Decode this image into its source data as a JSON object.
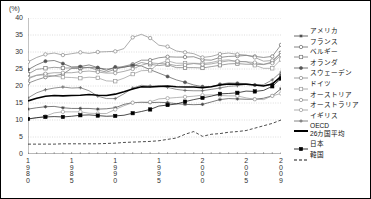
{
  "axis": {
    "unit_label": "(%)",
    "y_ticks": [
      "40",
      "35",
      "30",
      "25",
      "20",
      "15",
      "10",
      "5",
      "0"
    ],
    "x_ticks": [
      "1980",
      "1985",
      "1990",
      "1995",
      "2000",
      "2005",
      "2009"
    ]
  },
  "legend": {
    "items": [
      {
        "label": "アメリカ",
        "marker": "star",
        "color": "#444444",
        "dash": "none"
      },
      {
        "label": "フランス",
        "marker": "open-circle",
        "color": "#666666",
        "dash": "none"
      },
      {
        "label": "ベルギー",
        "marker": "open-square",
        "color": "#777777",
        "dash": "none"
      },
      {
        "label": "オランダ",
        "marker": "filled-circle",
        "color": "#555555",
        "dash": "none"
      },
      {
        "label": "スウェーデン",
        "marker": "open-circle",
        "color": "#888888",
        "dash": "none"
      },
      {
        "label": "ドイツ",
        "marker": "open-square",
        "color": "#999999",
        "dash": "none"
      },
      {
        "label": "オーストリア",
        "marker": "open-circle",
        "color": "#8a8a8a",
        "dash": "none"
      },
      {
        "label": "オーストラリア",
        "marker": "open-circle",
        "color": "#9a9a9a",
        "dash": "none"
      },
      {
        "label": "イギリス",
        "marker": "plus",
        "color": "#666666",
        "dash": "none"
      },
      {
        "label": "OECD",
        "label2": "26カ国平均",
        "marker": "thick-line",
        "color": "#000000",
        "dash": "none"
      },
      {
        "label": "日本",
        "marker": "filled-square",
        "color": "#000000",
        "dash": "none"
      },
      {
        "label": "韓国",
        "marker": "none",
        "color": "#000000",
        "dash": "dashed"
      }
    ]
  },
  "chart_data": {
    "type": "line",
    "title": "",
    "xlabel": "",
    "ylabel": "(%)",
    "ylim": [
      0,
      40
    ],
    "xlim": [
      1980,
      2009
    ],
    "grid": true,
    "legend_position": "right",
    "x": [
      1980,
      1981,
      1982,
      1983,
      1984,
      1985,
      1986,
      1987,
      1988,
      1989,
      1990,
      1991,
      1992,
      1993,
      1994,
      1995,
      1996,
      1997,
      1998,
      1999,
      2000,
      2001,
      2002,
      2003,
      2004,
      2005,
      2006,
      2007,
      2008,
      2009
    ],
    "series": [
      {
        "name": "アメリカ",
        "marker": "star",
        "values": [
          13.2,
          13.6,
          13.9,
          14.0,
          13.6,
          13.4,
          13.4,
          13.4,
          13.2,
          13.3,
          13.6,
          14.6,
          15.1,
          15.2,
          15.1,
          15.2,
          15.1,
          14.8,
          14.6,
          14.5,
          14.6,
          15.3,
          16.0,
          16.3,
          16.2,
          16.1,
          16.1,
          16.4,
          17.1,
          19.2
        ]
      },
      {
        "name": "フランス",
        "marker": "open-circle",
        "values": [
          20.8,
          21.8,
          22.6,
          23.0,
          23.5,
          25.2,
          25.2,
          25.5,
          25.3,
          25.0,
          25.1,
          25.8,
          26.4,
          27.6,
          27.6,
          28.3,
          28.6,
          28.5,
          28.5,
          28.6,
          27.7,
          27.6,
          28.4,
          28.7,
          28.8,
          29.0,
          28.7,
          28.4,
          28.7,
          32.1
        ]
      },
      {
        "name": "ベルギー",
        "marker": "open-square",
        "values": [
          23.5,
          24.9,
          25.2,
          25.5,
          25.3,
          25.3,
          25.4,
          25.4,
          24.7,
          24.1,
          24.9,
          25.6,
          25.9,
          26.9,
          26.4,
          26.0,
          26.3,
          25.4,
          25.4,
          25.4,
          25.3,
          25.7,
          26.1,
          26.5,
          26.6,
          26.4,
          26.4,
          26.3,
          27.1,
          29.7
        ]
      },
      {
        "name": "オランダ",
        "marker": "filled-circle",
        "values": [
          24.8,
          26.2,
          27.3,
          27.5,
          26.6,
          25.6,
          25.7,
          26.2,
          25.4,
          24.6,
          25.6,
          25.5,
          26.1,
          25.9,
          24.8,
          23.8,
          22.8,
          21.8,
          21.1,
          20.3,
          19.8,
          19.8,
          20.5,
          20.9,
          20.8,
          20.7,
          20.3,
          20.1,
          20.5,
          23.2
        ]
      },
      {
        "name": "スウェーデン",
        "marker": "open-circle",
        "values": [
          27.1,
          28.4,
          29.3,
          29.7,
          29.1,
          29.5,
          29.9,
          29.6,
          30.0,
          30.1,
          30.2,
          31.0,
          34.3,
          35.2,
          34.1,
          32.0,
          31.6,
          30.3,
          29.9,
          29.5,
          28.4,
          28.7,
          29.4,
          29.7,
          29.3,
          29.1,
          28.4,
          27.3,
          27.5,
          29.8
        ]
      },
      {
        "name": "ドイツ",
        "marker": "open-square",
        "values": [
          22.1,
          23.1,
          23.3,
          22.9,
          22.6,
          22.5,
          22.3,
          22.6,
          22.4,
          21.5,
          21.4,
          22.3,
          23.5,
          24.5,
          24.6,
          26.6,
          27.4,
          26.7,
          26.7,
          26.7,
          26.6,
          26.9,
          27.5,
          27.7,
          27.1,
          27.2,
          26.1,
          25.2,
          25.2,
          27.8
        ]
      },
      {
        "name": "オーストリア",
        "marker": "open-circle",
        "values": [
          22.4,
          23.2,
          23.6,
          23.9,
          23.9,
          23.9,
          24.2,
          24.4,
          24.1,
          23.8,
          23.8,
          24.3,
          25.0,
          26.1,
          26.8,
          26.6,
          26.5,
          26.0,
          26.2,
          26.6,
          26.3,
          26.5,
          27.0,
          27.4,
          27.3,
          27.1,
          26.9,
          26.4,
          26.7,
          29.1
        ]
      },
      {
        "name": "オーストラリア",
        "marker": "open-circle",
        "values": [
          10.3,
          10.6,
          11.1,
          12.1,
          12.4,
          12.4,
          12.4,
          12.0,
          11.9,
          11.9,
          13.1,
          14.2,
          15.1,
          15.2,
          15.3,
          16.2,
          16.4,
          16.6,
          16.8,
          17.0,
          17.3,
          17.4,
          17.2,
          17.1,
          17.1,
          16.5,
          16.1,
          16.0,
          17.1,
          17.8
        ]
      },
      {
        "name": "イギリス",
        "marker": "plus",
        "values": [
          16.5,
          18.0,
          18.9,
          19.4,
          19.7,
          19.4,
          19.5,
          18.6,
          17.0,
          16.3,
          16.3,
          17.7,
          19.4,
          20.2,
          20.0,
          19.9,
          19.6,
          19.0,
          18.7,
          18.6,
          18.6,
          19.0,
          19.4,
          19.9,
          20.1,
          20.5,
          20.3,
          20.4,
          21.8,
          24.1
        ]
      },
      {
        "name": "OECD 26カ国平均",
        "marker": "thick-line",
        "values": [
          15.6,
          16.4,
          17.0,
          17.2,
          17.1,
          17.2,
          17.3,
          17.5,
          17.3,
          17.2,
          17.6,
          18.3,
          19.1,
          19.8,
          19.7,
          19.9,
          20.0,
          19.8,
          19.7,
          19.7,
          19.5,
          19.8,
          20.3,
          20.6,
          20.5,
          20.5,
          20.3,
          20.0,
          20.6,
          22.7
        ]
      },
      {
        "name": "日本",
        "marker": "filled-square",
        "values": [
          10.3,
          10.7,
          10.9,
          11.0,
          10.9,
          11.1,
          11.4,
          11.5,
          11.3,
          11.1,
          11.2,
          11.4,
          12.0,
          12.5,
          13.1,
          14.1,
          14.4,
          14.7,
          15.4,
          16.0,
          16.5,
          17.0,
          17.7,
          17.8,
          18.0,
          18.5,
          18.4,
          18.7,
          19.9,
          22.2
        ]
      },
      {
        "name": "韓国",
        "marker": "none",
        "values": [
          2.9,
          2.9,
          2.9,
          2.9,
          3.0,
          3.0,
          3.0,
          3.0,
          3.0,
          3.1,
          3.2,
          3.4,
          3.5,
          3.6,
          3.7,
          3.9,
          4.3,
          4.7,
          5.8,
          6.6,
          5.2,
          5.8,
          6.0,
          6.4,
          6.6,
          6.9,
          7.6,
          8.3,
          9.0,
          10.0
        ]
      }
    ]
  }
}
